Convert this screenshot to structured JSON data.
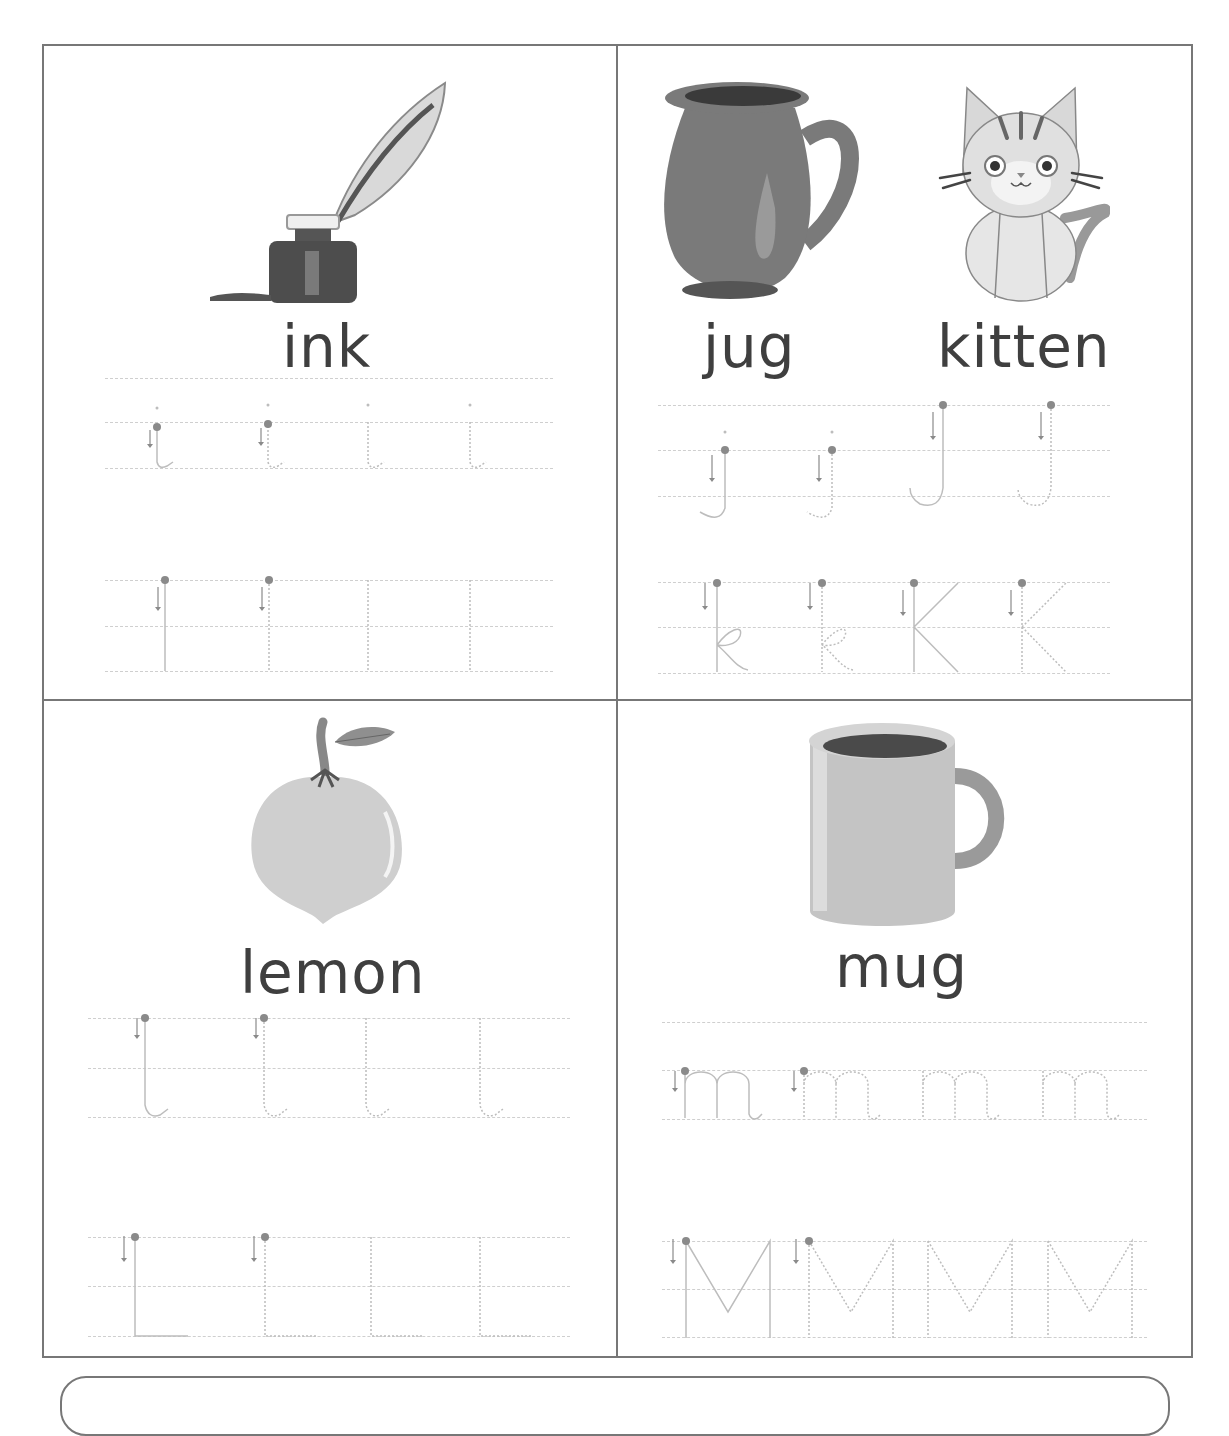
{
  "worksheet": {
    "cells": [
      {
        "id": "ink",
        "words": [
          "ink"
        ],
        "image": "ink-bottle-quill-icon",
        "rows": [
          {
            "case": "lower",
            "letter": "i",
            "count": 4
          },
          {
            "case": "upper",
            "letter": "I",
            "count": 4
          }
        ]
      },
      {
        "id": "jug-kitten",
        "words": [
          "jug",
          "kitten"
        ],
        "images": [
          "jug-icon",
          "kitten-icon"
        ],
        "rows": [
          {
            "case": "mixed",
            "letters": [
              "j",
              "j",
              "J",
              "J"
            ],
            "count": 4
          },
          {
            "case": "mixed",
            "letters": [
              "k",
              "k",
              "K",
              "K"
            ],
            "count": 4
          }
        ]
      },
      {
        "id": "lemon",
        "words": [
          "lemon"
        ],
        "image": "lemon-icon",
        "rows": [
          {
            "case": "lower",
            "letter": "l",
            "count": 4
          },
          {
            "case": "upper",
            "letter": "L",
            "count": 4
          }
        ]
      },
      {
        "id": "mug",
        "words": [
          "mug"
        ],
        "image": "mug-icon",
        "rows": [
          {
            "case": "lower",
            "letter": "m",
            "count": 4
          },
          {
            "case": "upper",
            "letter": "M",
            "count": 4
          }
        ]
      }
    ],
    "colors": {
      "border": "#777777",
      "text": "#3f3f3f",
      "guide": "#cfcfcf",
      "start_dot": "#8a8a8a",
      "trace": "#bdbdbd"
    }
  }
}
